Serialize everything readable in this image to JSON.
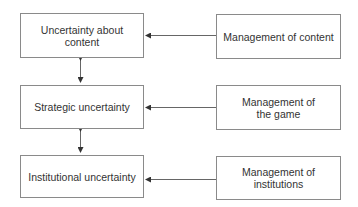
{
  "diagram": {
    "left_boxes": [
      {
        "label": "Uncertainty about content"
      },
      {
        "label": "Strategic uncertainty"
      },
      {
        "label": "Institutional uncertainty"
      }
    ],
    "right_boxes": [
      {
        "label": "Management of content"
      },
      {
        "label": "Management of the game"
      },
      {
        "label": "Management of institutions"
      }
    ],
    "colors": {
      "border": "#8a8a8a",
      "line": "#666666",
      "text": "#333333"
    }
  }
}
